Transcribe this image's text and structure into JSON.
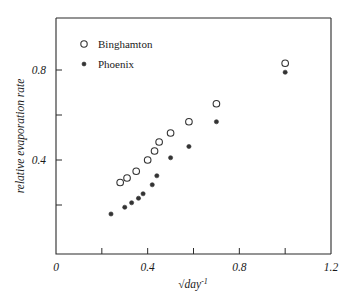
{
  "chart_data": {
    "type": "scatter",
    "title": "",
    "xlabel": "√dayâ»¹",
    "xlabel_parts": {
      "radical": "√",
      "base": "day",
      "exponent": "-1"
    },
    "ylabel": "relative evaporation rate",
    "xlim": [
      0,
      1.2
    ],
    "ylim": [
      0,
      0.95
    ],
    "x_ticks_major": [
      0,
      0.4,
      0.8,
      1.2
    ],
    "x_ticks_major_labels": [
      "0",
      "0.4",
      "0.8",
      "1.2"
    ],
    "x_ticks_minor": [
      0.2,
      0.6,
      1.0
    ],
    "y_ticks_major": [
      0.4,
      0.8
    ],
    "y_ticks_major_labels": [
      "0.4",
      "0.8"
    ],
    "y_ticks_minor": [
      0.2,
      0.6
    ],
    "grid": false,
    "legend_position": "upper-left-inside",
    "series": [
      {
        "name": "Binghamton",
        "marker": "open-circle",
        "color": "#333333",
        "points": [
          {
            "x": 0.28,
            "y": 0.3
          },
          {
            "x": 0.31,
            "y": 0.32
          },
          {
            "x": 0.35,
            "y": 0.35
          },
          {
            "x": 0.4,
            "y": 0.4
          },
          {
            "x": 0.43,
            "y": 0.44
          },
          {
            "x": 0.45,
            "y": 0.48
          },
          {
            "x": 0.5,
            "y": 0.52
          },
          {
            "x": 0.58,
            "y": 0.57
          },
          {
            "x": 0.7,
            "y": 0.65
          },
          {
            "x": 1.0,
            "y": 0.83
          }
        ]
      },
      {
        "name": "Phoenix",
        "marker": "filled-circle",
        "color": "#333333",
        "points": [
          {
            "x": 0.24,
            "y": 0.16
          },
          {
            "x": 0.3,
            "y": 0.19
          },
          {
            "x": 0.33,
            "y": 0.21
          },
          {
            "x": 0.36,
            "y": 0.23
          },
          {
            "x": 0.38,
            "y": 0.25
          },
          {
            "x": 0.42,
            "y": 0.29
          },
          {
            "x": 0.44,
            "y": 0.33
          },
          {
            "x": 0.5,
            "y": 0.41
          },
          {
            "x": 0.58,
            "y": 0.46
          },
          {
            "x": 0.7,
            "y": 0.57
          },
          {
            "x": 1.0,
            "y": 0.79
          }
        ]
      }
    ],
    "legend": [
      {
        "label": "Binghamton",
        "marker": "open-circle"
      },
      {
        "label": "Phoenix",
        "marker": "filled-circle"
      }
    ]
  },
  "colors": {
    "axis": "#2b2b2b",
    "text": "#1a1a1a",
    "marker": "#333333",
    "background": "#ffffff"
  }
}
